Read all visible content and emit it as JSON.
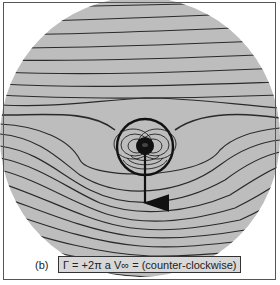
{
  "figure": {
    "panel_label": "(b)",
    "caption": "Γ = +2π a V∞ = (counter-clockwise)",
    "colors": {
      "disk": "#bdbdbd",
      "streamline": "#2a2a2a",
      "background": "#ffffff",
      "caption_box": "#d8d8d8"
    },
    "elements": {
      "flow_field": "streamlines around rotating cylinder",
      "cylinder": "bold circle of radius a",
      "doublet": "dense closed streamlines near center",
      "force_arrow": "downward arrow (lift vector)"
    }
  }
}
